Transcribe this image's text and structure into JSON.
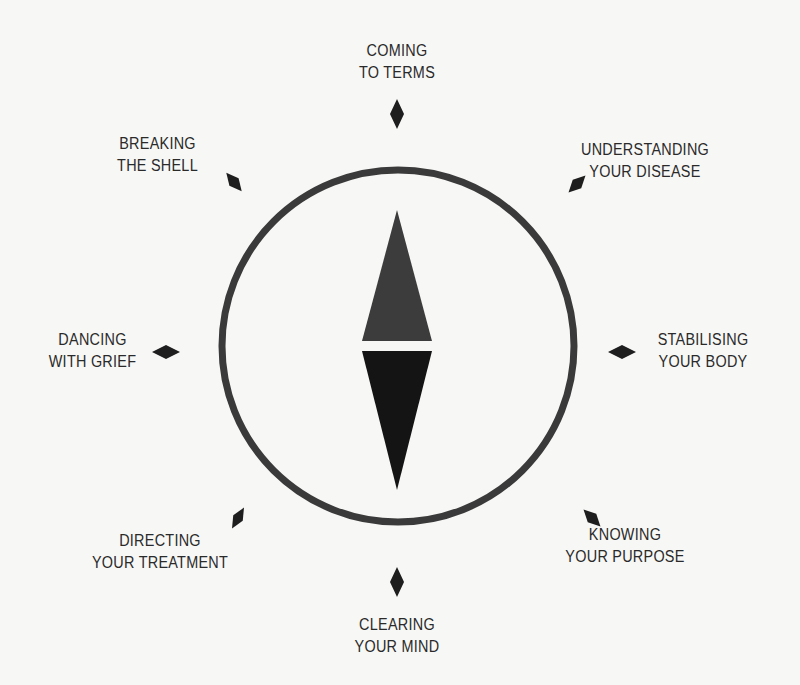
{
  "diagram": {
    "type": "compass",
    "colors": {
      "background": "#f7f7f5",
      "ring": "#3a3a3a",
      "needle_north": "#3c3c3c",
      "needle_south": "#141414",
      "markers": "#1e1e1e",
      "text": "#2a2a2a"
    },
    "compass": {
      "center": [
        398,
        346
      ],
      "radius": 176,
      "ring_width": 7
    },
    "points": [
      {
        "id": "n",
        "line1": "Coming",
        "line2": "to Terms",
        "marker": [
          397,
          114
        ],
        "angle": 0
      },
      {
        "id": "ne",
        "line1": "Understanding",
        "line2": "Your Disease",
        "marker": [
          577,
          184
        ],
        "angle": 45
      },
      {
        "id": "e",
        "line1": "Stabilising",
        "line2": "Your Body",
        "marker": [
          622,
          352
        ],
        "angle": 90
      },
      {
        "id": "se",
        "line1": "Knowing",
        "line2": "Your Purpose",
        "marker": [
          592,
          518
        ],
        "angle": 135
      },
      {
        "id": "s",
        "line1": "Clearing",
        "line2": "Your Mind",
        "marker": [
          397,
          582
        ],
        "angle": 180
      },
      {
        "id": "sw",
        "line1": "Directing",
        "line2": "Your Treatment",
        "marker": [
          238,
          518
        ],
        "angle": 225
      },
      {
        "id": "w",
        "line1": "Dancing",
        "line2": "with Grief",
        "marker": [
          166,
          352
        ],
        "angle": 270
      },
      {
        "id": "nw",
        "line1": "Breaking",
        "line2": "the Shell",
        "marker": [
          234,
          182
        ],
        "angle": 315
      }
    ]
  }
}
